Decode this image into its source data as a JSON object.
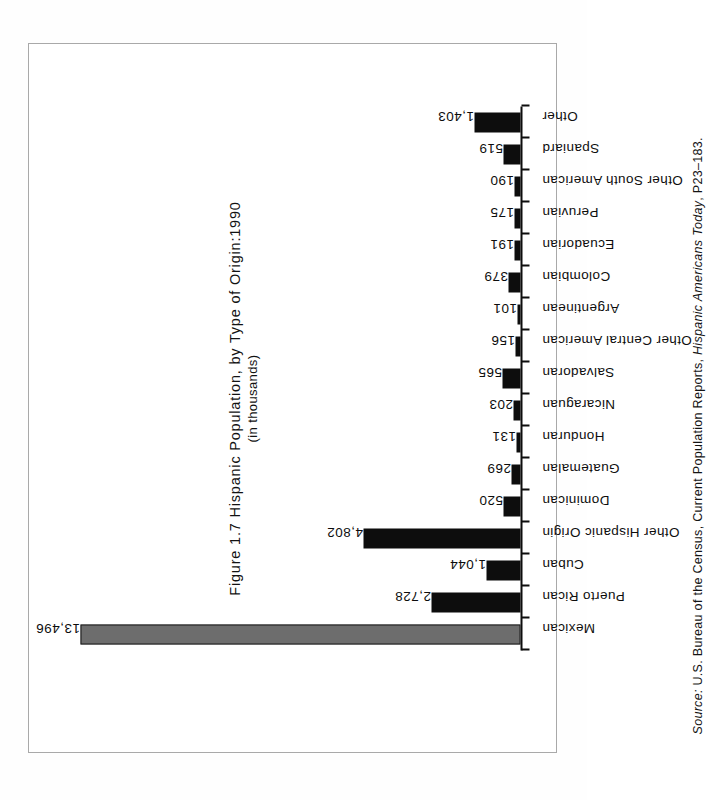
{
  "figure": {
    "title": "Figure 1.7  Hispanic Population, by Type of Origin:1990",
    "subtitle": "(in thousands)",
    "source_lead": "Source:",
    "source_text_before": " U.S. Bureau of the Census, Current Population Reports, ",
    "source_work": "Hispanic Americans Today",
    "source_text_after": ", P23–183."
  },
  "colors": {
    "bar_default": "#0d0d0d",
    "bar_highlight": "#6d6d6d",
    "axis": "#0d0d0d",
    "frame": "#a9a9a9",
    "text": "#121212"
  },
  "chart_data": {
    "type": "bar",
    "title": "Figure 1.7  Hispanic Population, by Type of Origin:1990",
    "subtitle": "(in thousands)",
    "orientation": "vertical-bars-on-rotated-page",
    "xlabel": "",
    "ylabel": "(in thousands)",
    "ylim": [
      0,
      13496
    ],
    "grid": false,
    "legend": "none",
    "units": "thousands",
    "categories": [
      "Mexican",
      "Puerto Rican",
      "Cuban",
      "Other Hispanic Origin",
      "Dominican",
      "Guatemalan",
      "Honduran",
      "Nicaraguan",
      "Salvadoran",
      "Other Central American",
      "Argentinean",
      "Colombian",
      "Ecuadorian",
      "Peruvian",
      "Other South American",
      "Spaniard",
      "Other"
    ],
    "values": [
      13496,
      2728,
      1044,
      4802,
      520,
      269,
      131,
      203,
      565,
      156,
      101,
      379,
      191,
      175,
      190,
      519,
      1403
    ],
    "value_labels": [
      "13,496",
      "2,728",
      "1,044",
      "4,802",
      "520",
      "269",
      "131",
      "203",
      "565",
      "156",
      "101",
      "379",
      "191",
      "175",
      "190",
      "519",
      "1,403"
    ],
    "highlighted_category": "Mexican"
  }
}
